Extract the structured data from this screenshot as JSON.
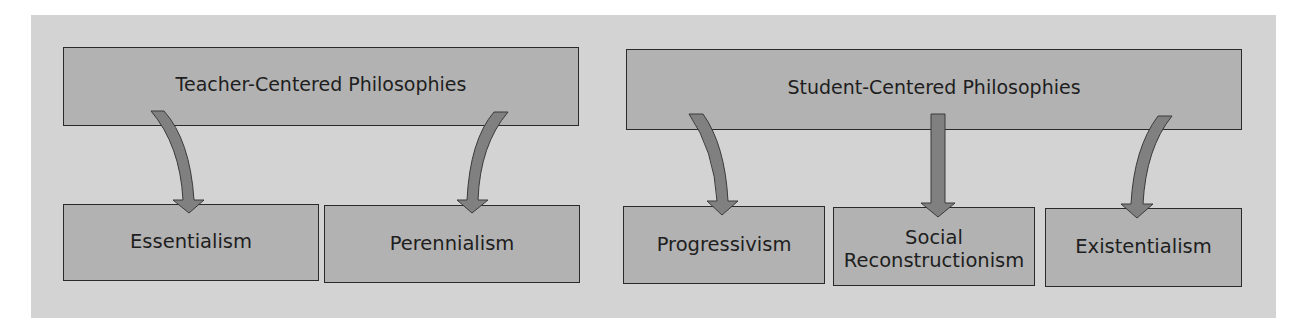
{
  "diagram": {
    "colors": {
      "background": "#d3d3d3",
      "box_fill": "#b2b2b2",
      "box_border": "#2a2a2a",
      "arrow_fill": "#808080",
      "text": "#1e1e1e"
    },
    "groups": [
      {
        "title": "Teacher-Centered Philosophies",
        "children": [
          "Essentialism",
          "Perennialism"
        ]
      },
      {
        "title": "Student-Centered Philosophies",
        "children": [
          "Progressivism",
          "Social Reconstructionism",
          "Existentialism"
        ]
      }
    ],
    "labels": {
      "teacher_centered": "Teacher-Centered Philosophies",
      "student_centered": "Student-Centered Philosophies",
      "essentialism": "Essentialism",
      "perennialism": "Perennialism",
      "progressivism": "Progressivism",
      "social_line1": "Social",
      "social_line2": "Reconstructionism",
      "existentialism": "Existentialism"
    },
    "edges": [
      {
        "from": "Teacher-Centered Philosophies",
        "to": "Essentialism",
        "style": "curved"
      },
      {
        "from": "Teacher-Centered Philosophies",
        "to": "Perennialism",
        "style": "curved"
      },
      {
        "from": "Student-Centered Philosophies",
        "to": "Progressivism",
        "style": "curved"
      },
      {
        "from": "Student-Centered Philosophies",
        "to": "Social Reconstructionism",
        "style": "straight"
      },
      {
        "from": "Student-Centered Philosophies",
        "to": "Existentialism",
        "style": "curved"
      }
    ]
  }
}
